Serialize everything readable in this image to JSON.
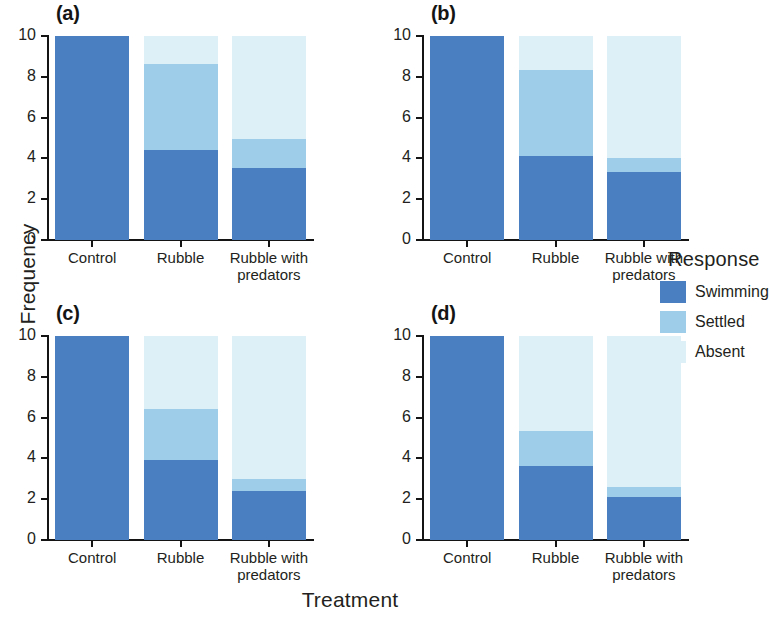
{
  "chart_data": {
    "type": "bar",
    "subtype": "stacked-bar",
    "title": "",
    "xlabel": "Treatment",
    "ylabel": "Frequency",
    "ylim": [
      0,
      10
    ],
    "yticks": [
      0,
      2,
      4,
      6,
      8,
      10
    ],
    "categories": [
      "Control",
      "Rubble",
      "Rubble with predators"
    ],
    "category_lines": [
      [
        "Control"
      ],
      [
        "Rubble"
      ],
      [
        "Rubble with",
        "predators"
      ]
    ],
    "legend": {
      "title": "Response",
      "position": "right",
      "entries": [
        {
          "label": "Swimming",
          "color": "#4a7fc1"
        },
        {
          "label": "Settled",
          "color": "#9dcde8"
        },
        {
          "label": "Absent",
          "color": "#ddf0f8"
        }
      ]
    },
    "grid": false,
    "panels": [
      {
        "tag": "(a)",
        "series": [
          {
            "name": "Swimming",
            "values": [
              10.0,
              4.4,
              3.55
            ]
          },
          {
            "name": "Settled",
            "values": [
              0.0,
              4.25,
              1.4
            ]
          },
          {
            "name": "Absent",
            "values": [
              0.0,
              1.35,
              5.05
            ]
          }
        ],
        "cumulative_tops": [
          [
            10.0,
            10.0,
            10.0
          ],
          [
            4.4,
            8.65,
            10.0
          ],
          [
            3.55,
            4.95,
            10.0
          ]
        ]
      },
      {
        "tag": "(b)",
        "series": [
          {
            "name": "Swimming",
            "values": [
              10.0,
              4.1,
              3.35
            ]
          },
          {
            "name": "Settled",
            "values": [
              0.0,
              4.25,
              0.65
            ]
          },
          {
            "name": "Absent",
            "values": [
              0.0,
              1.65,
              6.0
            ]
          }
        ],
        "cumulative_tops": [
          [
            10.0,
            10.0,
            10.0
          ],
          [
            4.1,
            8.35,
            10.0
          ],
          [
            3.35,
            4.0,
            10.0
          ]
        ]
      },
      {
        "tag": "(c)",
        "series": [
          {
            "name": "Swimming",
            "values": [
              10.0,
              3.9,
              2.4
            ]
          },
          {
            "name": "Settled",
            "values": [
              0.0,
              2.5,
              0.6
            ]
          },
          {
            "name": "Absent",
            "values": [
              0.0,
              3.6,
              7.0
            ]
          }
        ],
        "cumulative_tops": [
          [
            10.0,
            10.0,
            10.0
          ],
          [
            3.9,
            6.4,
            10.0
          ],
          [
            2.4,
            3.0,
            10.0
          ]
        ]
      },
      {
        "tag": "(d)",
        "series": [
          {
            "name": "Swimming",
            "values": [
              10.0,
              3.65,
              2.1
            ]
          },
          {
            "name": "Settled",
            "values": [
              0.0,
              1.7,
              0.5
            ]
          },
          {
            "name": "Absent",
            "values": [
              0.0,
              4.65,
              7.4
            ]
          }
        ],
        "cumulative_tops": [
          [
            10.0,
            10.0,
            10.0
          ],
          [
            3.65,
            5.35,
            10.0
          ],
          [
            2.1,
            2.6,
            10.0
          ]
        ]
      }
    ]
  }
}
